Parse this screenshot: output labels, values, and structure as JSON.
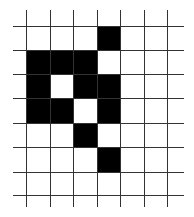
{
  "grid": {
    "h_lines_y": [
      26,
      50,
      74,
      98,
      123,
      147,
      172,
      195
    ],
    "h_line_x_start": 13,
    "h_line_x_end": 184,
    "v_lines_x": [
      26,
      50,
      73,
      97,
      120,
      144,
      167
    ],
    "v_line_y_start": 10,
    "v_line_y_end": 207,
    "line_color": "#333333",
    "fill_color": "#000000",
    "filled_cells": [
      {
        "row": 0,
        "col": 4
      },
      {
        "row": 1,
        "col": 1
      },
      {
        "row": 1,
        "col": 2
      },
      {
        "row": 1,
        "col": 3
      },
      {
        "row": 2,
        "col": 1
      },
      {
        "row": 2,
        "col": 3
      },
      {
        "row": 2,
        "col": 4
      },
      {
        "row": 3,
        "col": 1
      },
      {
        "row": 3,
        "col": 2
      },
      {
        "row": 3,
        "col": 4
      },
      {
        "row": 4,
        "col": 3
      },
      {
        "row": 5,
        "col": 4
      }
    ]
  }
}
